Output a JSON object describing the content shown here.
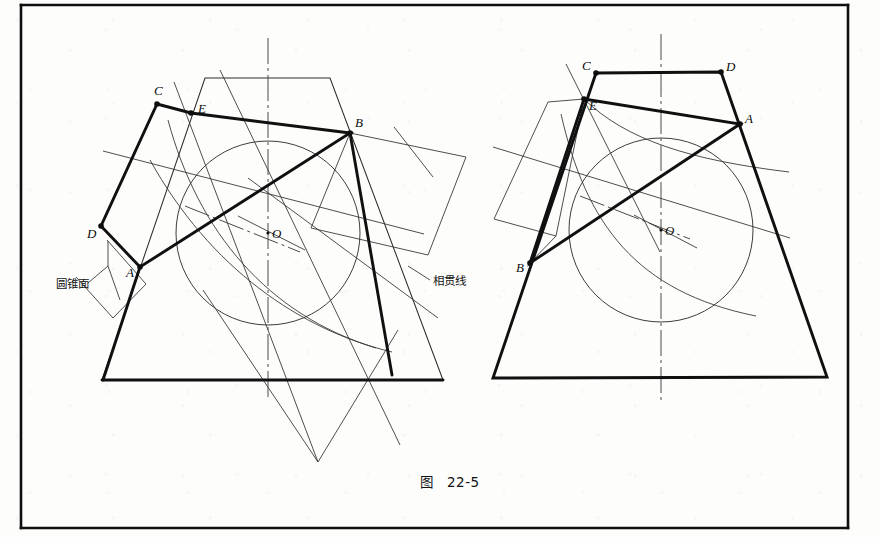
{
  "figure": {
    "caption": "图   22-5",
    "caption_prefix": "图",
    "caption_number": "22-5",
    "annotations": [
      {
        "id": "cone-surface",
        "text": "圆锥面",
        "meaning": "conical surface",
        "x": 58,
        "y": 285
      },
      {
        "id": "intersection-curve",
        "text": "相贯线",
        "meaning": "intersection line",
        "x": 433,
        "y": 282
      }
    ]
  },
  "left_view": {
    "name": "left-projection-view",
    "vertex_labels": [
      {
        "id": "C",
        "text": "C",
        "x": 154,
        "y": 95,
        "dot_x": 157,
        "dot_y": 104
      },
      {
        "id": "E",
        "text": "E",
        "x": 198,
        "y": 113,
        "dot_x": 191,
        "dot_y": 113
      },
      {
        "id": "B",
        "text": "B",
        "x": 355,
        "y": 127,
        "dot_x": 350,
        "dot_y": 133
      },
      {
        "id": "D",
        "text": "D",
        "x": 89,
        "y": 236,
        "dot_x": 101,
        "dot_y": 226
      },
      {
        "id": "A",
        "text": "A",
        "x": 127,
        "y": 276,
        "dot_x": 140,
        "dot_y": 267
      },
      {
        "id": "O",
        "text": "O",
        "x": 272,
        "y": 237,
        "dot_x": 268,
        "dot_y": 233
      }
    ],
    "circle": {
      "cx": 268,
      "cy": 233,
      "r": 92
    },
    "cut_plane_polygon": "157,104 191,113 350,133 140,267 101,226",
    "cone_outline": "205,78 330,78 443,380 102,380",
    "axis_x": 268
  },
  "right_view": {
    "name": "right-projection-view",
    "vertex_labels": [
      {
        "id": "C",
        "text": "C",
        "x": 585,
        "y": 70,
        "dot_x": 596,
        "dot_y": 73
      },
      {
        "id": "D",
        "text": "D",
        "x": 728,
        "y": 70,
        "dot_x": 721,
        "dot_y": 72
      },
      {
        "id": "E",
        "text": "E",
        "x": 590,
        "y": 107,
        "dot_x": 584,
        "dot_y": 99
      },
      {
        "id": "A",
        "text": "A",
        "x": 745,
        "y": 123,
        "dot_x": 740,
        "dot_y": 124
      },
      {
        "id": "B",
        "text": "B",
        "x": 518,
        "y": 270,
        "dot_x": 530,
        "dot_y": 263
      },
      {
        "id": "O",
        "text": "O",
        "x": 665,
        "y": 234,
        "dot_x": 661,
        "dot_y": 230
      }
    ],
    "circle": {
      "cx": 661,
      "cy": 230,
      "r": 92
    },
    "cone_outline": "596,73 721,72 827,377 493,378",
    "axis_x": 661
  },
  "page_frame": {
    "left": 21,
    "top": 5,
    "right": 848,
    "bottom": 528
  },
  "colors": {
    "ink": "#101010",
    "thin_ink": "#3a3a3a",
    "paper": "#fdfdfc"
  }
}
